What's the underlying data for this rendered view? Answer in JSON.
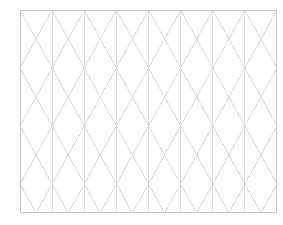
{
  "canvas": {
    "width": 283,
    "height": 225,
    "background_color": "#ffffff",
    "title": "triangular-grid-paper"
  },
  "frame": {
    "name": "grid-border-rectangle",
    "x": 20,
    "y": 10,
    "width": 257,
    "height": 203,
    "stroke_color": "#c6c6c6",
    "stroke_width": 1,
    "fill_color": "#ffffff"
  },
  "grid": {
    "type": "isometric-triangular",
    "line_color": "#dcdcdc",
    "line_width": 1,
    "vertical_spacing": 32.125,
    "row_spacing": 29.0,
    "vertical_line_count": 9,
    "horizontal_row_count": 8,
    "diagonal_angle_degrees": 60,
    "diagonal_direction_down_right": true,
    "diagonal_direction_down_left": true,
    "description": "Equilateral triangle isometric graph paper: evenly spaced vertical rules crossed by two families of diagonal rules at plus and minus sixty degrees forming triangles and six-pointed star intersections."
  },
  "chart_data": {
    "type": "table",
    "title": "",
    "xlabel": "",
    "ylabel": "",
    "categories": [],
    "values": [],
    "note": "Blank triangular isometric graph paper; no plotted data series present."
  }
}
